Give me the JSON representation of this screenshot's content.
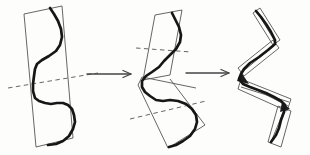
{
  "figure": {
    "width": 310,
    "height": 155,
    "colors": {
      "background": "#fdfdfc",
      "thin_line": "#555555",
      "thick_curve": "#161616",
      "dashed_line": "#666666",
      "arrow": "#444444",
      "junction_fill": "#1c1c1c"
    },
    "strokes": {
      "thin_width": 0.9,
      "thick_width": 2.7,
      "dash_width": 1.0,
      "dash_pattern": "4.5 3.5",
      "arrow_width": 1.3,
      "arrow_barb_length": 8,
      "arrow_barb_halfwidth": 3.5
    },
    "panels": [
      {
        "name": "single-strip",
        "rects": [
          [
            [
              24,
              14
            ],
            [
              62,
              6
            ],
            [
              73,
              138
            ],
            [
              36,
              147
            ]
          ]
        ],
        "dashed": [
          [
            [
              8,
              88
            ],
            [
              98,
              73
            ]
          ]
        ],
        "thin_lines": [],
        "fills": [],
        "curve": [
          [
            50,
            8
          ],
          [
            54,
            14
          ],
          [
            58,
            21
          ],
          [
            61,
            29
          ],
          [
            62,
            37
          ],
          [
            60,
            45
          ],
          [
            56,
            51
          ],
          [
            49,
            56
          ],
          [
            42,
            60
          ],
          [
            37,
            64
          ],
          [
            35,
            69
          ],
          [
            34,
            76
          ],
          [
            33,
            84
          ],
          [
            33,
            91
          ],
          [
            35,
            98
          ],
          [
            39,
            101
          ],
          [
            45,
            103
          ],
          [
            51,
            104
          ],
          [
            57,
            103
          ],
          [
            63,
            103
          ],
          [
            68,
            105
          ],
          [
            72,
            109
          ],
          [
            74,
            115
          ],
          [
            75,
            122
          ],
          [
            73,
            129
          ],
          [
            69,
            136
          ],
          [
            63,
            141
          ],
          [
            56,
            144
          ],
          [
            48,
            145
          ]
        ]
      },
      {
        "name": "two-strips",
        "rects": [
          [
            [
              155,
              15
            ],
            [
              182,
              10
            ],
            [
              170,
              75
            ],
            [
              143,
              80
            ]
          ]
        ],
        "dashed": [
          [
            [
              136,
              48
            ],
            [
              191,
              52
            ]
          ],
          [
            [
              130,
              119
            ],
            [
              206,
              101
            ]
          ]
        ],
        "thin_lines": [
          [
            [
              142,
              77
            ],
            [
              196,
              88
            ]
          ],
          [
            [
              170,
              79
            ],
            [
              205,
              125
            ]
          ],
          [
            [
              205,
              125
            ],
            [
              168,
              148
            ]
          ],
          [
            [
              138,
              85
            ],
            [
              168,
              148
            ]
          ],
          [
            [
              142,
              77
            ],
            [
              138,
              85
            ]
          ]
        ],
        "fills": [],
        "curve": [
          [
            172,
            13
          ],
          [
            175,
            19
          ],
          [
            179,
            27
          ],
          [
            181,
            35
          ],
          [
            180,
            42
          ],
          [
            176,
            49
          ],
          [
            170,
            55
          ],
          [
            164,
            61
          ],
          [
            159,
            67
          ],
          [
            152,
            72
          ],
          [
            146,
            76
          ],
          [
            142,
            81
          ],
          [
            142,
            87
          ],
          [
            145,
            92
          ],
          [
            150,
            96
          ],
          [
            156,
            100
          ],
          [
            163,
            101
          ],
          [
            170,
            100
          ],
          [
            178,
            101
          ],
          [
            186,
            104
          ],
          [
            192,
            109
          ],
          [
            196,
            115
          ],
          [
            197,
            122
          ],
          [
            195,
            129
          ],
          [
            190,
            136
          ],
          [
            183,
            141
          ],
          [
            176,
            145
          ],
          [
            169,
            147
          ]
        ]
      },
      {
        "name": "strip-tree",
        "rects": [
          [
            [
              260,
              8
            ],
            [
              280,
              40
            ],
            [
              273,
              45
            ],
            [
              253,
              13
            ]
          ],
          [
            [
              273,
              40
            ],
            [
              279,
              48
            ],
            [
              244,
              76
            ],
            [
              238,
              68
            ]
          ],
          [
            [
              241,
              79
            ],
            [
              291,
              99
            ],
            [
              287,
              111
            ],
            [
              238,
              89
            ]
          ],
          [
            [
              278,
              106
            ],
            [
              291,
              111
            ],
            [
              281,
              147
            ],
            [
              268,
              142
            ]
          ]
        ],
        "dashed": [],
        "thin_lines": [
          [
            [
              257,
              12
            ],
            [
              276,
              43
            ]
          ],
          [
            [
              276,
              44
            ],
            [
              241,
              73
            ]
          ],
          [
            [
              243,
              83
            ],
            [
              288,
              106
            ]
          ],
          [
            [
              241,
              87
            ],
            [
              289,
              102
            ]
          ],
          [
            [
              285,
              108
            ],
            [
              271,
              142
            ]
          ]
        ],
        "fills": [
          [
            [
              241,
              72
            ],
            [
              249,
              84
            ],
            [
              237,
              81
            ]
          ],
          [
            [
              282,
              102
            ],
            [
              290,
              109
            ],
            [
              280,
              112
            ]
          ]
        ],
        "curve": [
          [
            256,
            11
          ],
          [
            261,
            17
          ],
          [
            266,
            24
          ],
          [
            271,
            32
          ],
          [
            275,
            40
          ],
          [
            275,
            44
          ],
          [
            268,
            50
          ],
          [
            259,
            57
          ],
          [
            250,
            63
          ],
          [
            244,
            69
          ],
          [
            241,
            74
          ],
          [
            239,
            79
          ],
          [
            243,
            84
          ],
          [
            250,
            87
          ],
          [
            258,
            90
          ],
          [
            266,
            93
          ],
          [
            274,
            97
          ],
          [
            281,
            101
          ],
          [
            285,
            105
          ],
          [
            284,
            112
          ],
          [
            281,
            120
          ],
          [
            279,
            128
          ],
          [
            276,
            135
          ],
          [
            271,
            142
          ]
        ]
      }
    ],
    "arrows": [
      {
        "name": "arrow-first-to-second",
        "from": [
          87,
          74
        ],
        "to": [
          131,
          74
        ]
      },
      {
        "name": "arrow-second-to-third",
        "from": [
          186,
          73
        ],
        "to": [
          229,
          73
        ]
      }
    ]
  }
}
